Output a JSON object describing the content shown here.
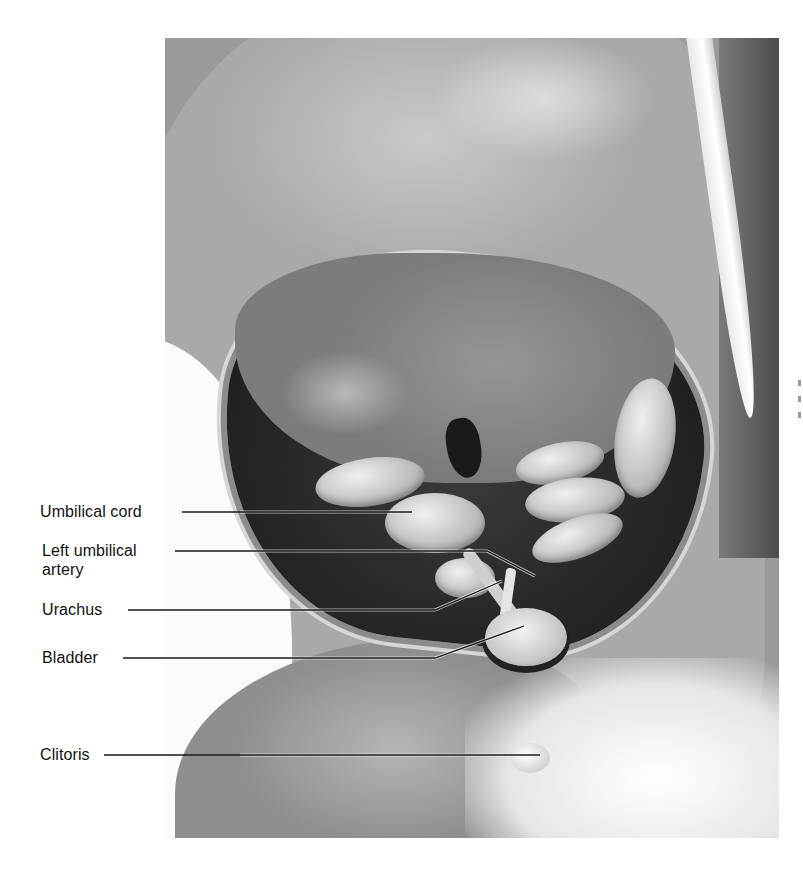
{
  "figure": {
    "style": "grayscale photograph with leader-line labels",
    "labels": [
      {
        "id": "umbilical-cord",
        "text": "Umbilical cord",
        "lines": [
          "Umbilical cord"
        ]
      },
      {
        "id": "left-umbilical-artery",
        "text": "Left umbilical artery",
        "lines": [
          "Left umbilical",
          "artery"
        ]
      },
      {
        "id": "urachus",
        "text": "Urachus",
        "lines": [
          "Urachus"
        ]
      },
      {
        "id": "bladder",
        "text": "Bladder",
        "lines": [
          "Bladder"
        ]
      },
      {
        "id": "clitoris",
        "text": "Clitoris",
        "lines": [
          "Clitoris"
        ]
      }
    ]
  },
  "colors": {
    "label_text": "#111111",
    "leader_line": "#1a1a1a",
    "page_background": "#ffffff"
  }
}
